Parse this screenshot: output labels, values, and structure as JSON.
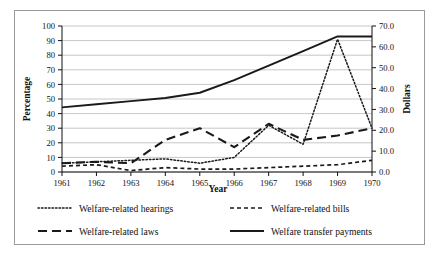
{
  "chart_data": {
    "type": "line",
    "title": "",
    "xlabel": "Year",
    "ylabel": "Percentage",
    "y2label": "Dollars",
    "x": [
      1961,
      1962,
      1963,
      1964,
      1965,
      1966,
      1967,
      1968,
      1969,
      1970
    ],
    "xtick_labels": [
      "1961",
      "1962",
      "1963",
      "1964",
      "1965",
      "1966",
      "1967",
      "1968",
      "1969",
      "1970"
    ],
    "xlim": [
      1961,
      1970
    ],
    "ylim": [
      0,
      100
    ],
    "ytick_labels": [
      "0",
      "10",
      "20",
      "30",
      "40",
      "50",
      "60",
      "70",
      "80",
      "90",
      "100"
    ],
    "ytick_values": [
      0,
      10,
      20,
      30,
      40,
      50,
      60,
      70,
      80,
      90,
      100
    ],
    "y2lim": [
      0.0,
      70.0
    ],
    "y2tick_labels": [
      "0.0",
      "10.0",
      "20.0",
      "30.0",
      "40.0",
      "50.0",
      "60.0",
      "70.0"
    ],
    "y2tick_values": [
      0,
      10,
      20,
      30,
      40,
      50,
      60,
      70
    ],
    "grid": "horizontal",
    "grid_color": "#b9b9b9",
    "legend_position": "bottom",
    "line_color": "#1a1a1a",
    "series": [
      {
        "name": "Welfare-related hearings",
        "axis": "left",
        "style": "dotted",
        "dash": "1.5 2",
        "width": 1.5,
        "values": [
          6,
          7,
          8,
          9,
          6,
          10,
          32,
          19,
          91,
          30
        ]
      },
      {
        "name": "Welfare-related bills",
        "axis": "left",
        "style": "short-dash",
        "dash": "4 3",
        "width": 1.7,
        "values": [
          4,
          5,
          1,
          3,
          2,
          2,
          3,
          4,
          5,
          8
        ]
      },
      {
        "name": "Welfare-related laws",
        "axis": "left",
        "style": "long-dash",
        "dash": "9 5",
        "width": 2.1,
        "values": [
          6,
          7,
          6,
          22,
          30,
          17,
          33,
          22,
          25,
          30
        ]
      },
      {
        "name": "Welfare transfer payments",
        "axis": "right",
        "style": "solid",
        "dash": "0",
        "width": 1.9,
        "values": [
          31.0,
          32.5,
          34.0,
          35.5,
          38.0,
          44.0,
          51.0,
          58.0,
          65.0,
          65.0
        ]
      }
    ]
  },
  "legend": {
    "items": [
      {
        "label": "Welfare-related hearings",
        "style": "dotted"
      },
      {
        "label": "Welfare-related bills",
        "style": "short-dash"
      },
      {
        "label": "Welfare-related laws",
        "style": "long-dash"
      },
      {
        "label": "Welfare transfer payments",
        "style": "solid"
      }
    ]
  }
}
